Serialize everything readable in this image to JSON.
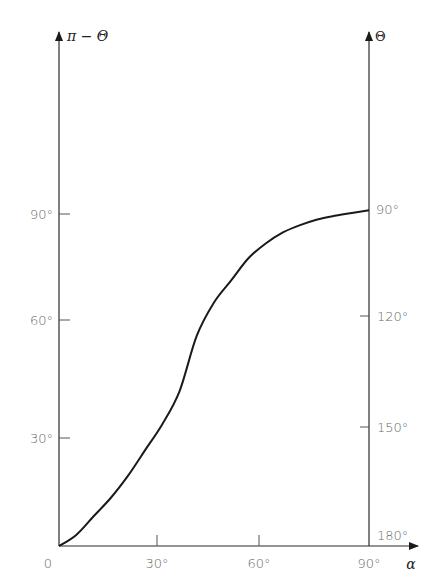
{
  "chart_data": {
    "type": "line",
    "title": "",
    "xlabel": "α",
    "ylabel_left": "π − Θ",
    "ylabel_right": "Θ",
    "xlim": [
      0,
      90
    ],
    "ylim_left": [
      0,
      90
    ],
    "ylim_right": [
      180,
      90
    ],
    "grid": false,
    "legend": null,
    "x_ticks": [
      "0",
      "30°",
      "60°",
      "90°"
    ],
    "y_left_ticks": [
      "30°",
      "60°",
      "90°"
    ],
    "y_right_ticks": [
      "180°",
      "150°",
      "120°",
      "90°"
    ],
    "series": [
      {
        "name": "π − Θ vs α",
        "x": [
          0,
          5,
          10,
          15,
          20,
          25,
          30,
          35,
          40,
          45,
          50,
          55,
          60,
          65,
          70,
          75,
          80,
          85,
          90
        ],
        "values": [
          0,
          3,
          8,
          13,
          19,
          26,
          33,
          42,
          57,
          66,
          72,
          78,
          82,
          85,
          87,
          88.5,
          89.5,
          90.3,
          91
        ]
      }
    ]
  },
  "labels": {
    "origin": "0",
    "x_30": "30°",
    "x_60": "60°",
    "x_90": "90°",
    "y_left_30": "30°",
    "y_left_60": "60°",
    "y_left_90": "90°",
    "y_right_90": "90°",
    "y_right_120": "120°",
    "y_right_150": "150°",
    "y_right_180": "180°",
    "x_axis_title": "α",
    "left_axis_title": "π − Θ",
    "right_axis_title": "Θ"
  }
}
